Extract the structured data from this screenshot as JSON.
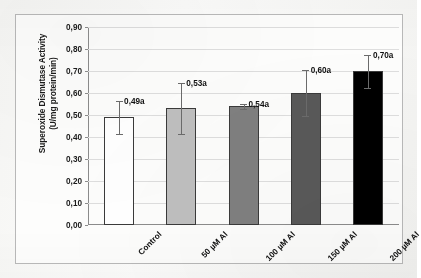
{
  "chart_data": {
    "type": "bar",
    "title": "",
    "subtitle": "",
    "xlabel": "",
    "ylabel": "Superoxide Dismutase Activity (U/mg protein/min)",
    "ylabel_lines": [
      "Superoxide Dismutase Activity",
      "(U/mg protein/min)"
    ],
    "categories": [
      "Control",
      "50 µM Al",
      "100 µM Al",
      "150 µM Al",
      "200 µM Al"
    ],
    "values": [
      0.49,
      0.53,
      0.54,
      0.6,
      0.7
    ],
    "value_labels": [
      "0,49a",
      "0,53a",
      "0,54a",
      "0,60a",
      "0,70a"
    ],
    "errors": [
      0.075,
      0.115,
      0.012,
      0.105,
      0.075
    ],
    "bar_colors": [
      "#ffffff",
      "#bfbfbf",
      "#808080",
      "#595959",
      "#000000"
    ],
    "bar_border_color": "#3a3a3a",
    "ylim": [
      0.0,
      0.9
    ],
    "ytick_values": [
      0.0,
      0.1,
      0.2,
      0.3,
      0.4,
      0.5,
      0.6,
      0.7,
      0.8,
      0.9
    ],
    "ytick_labels": [
      "0,00",
      "0,10",
      "0,20",
      "0,30",
      "0,40",
      "0,50",
      "0,60",
      "0,70",
      "0,80",
      "0,90"
    ],
    "grid": true,
    "grid_axis": "y",
    "legend": false,
    "legend_position": "none",
    "decimal_separator": ",",
    "category_label_rotation": -45,
    "annotation_note": "Letter 'a' suffix on each value denotes no significant difference between treatments"
  },
  "figure": {
    "frame_border_color": "#b9b9b9",
    "plot_background": "#fdfdfc",
    "axis_color": "#8c8c8c",
    "gridline_color": "#dedede",
    "text_color": "#111111"
  }
}
